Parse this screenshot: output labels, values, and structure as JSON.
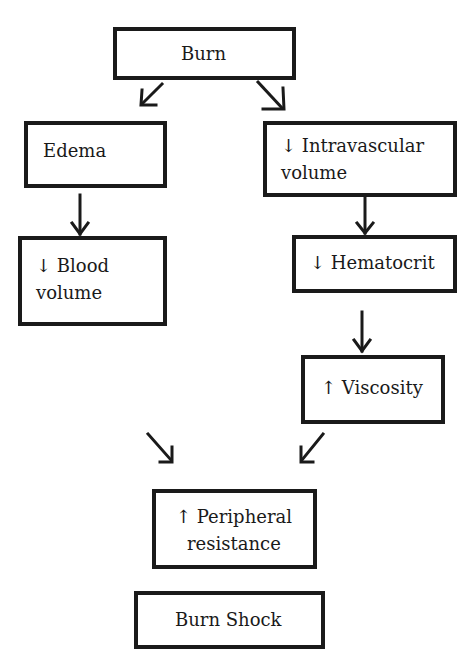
{
  "diagram": {
    "nodes": [
      {
        "id": "burn",
        "label": "Burn"
      },
      {
        "id": "edema",
        "label": "Edema"
      },
      {
        "id": "intravascular",
        "line1": "↓ Intravascular",
        "line2": "volume"
      },
      {
        "id": "blood_volume",
        "line1": "↓ Blood",
        "line2": "volume"
      },
      {
        "id": "hematocrit",
        "label": "↓ Hematocrit"
      },
      {
        "id": "viscosity",
        "label": "↑ Viscosity"
      },
      {
        "id": "peripheral",
        "line1": "↑ Peripheral",
        "line2": "resistance"
      },
      {
        "id": "burn_shock",
        "label": "Burn Shock"
      }
    ],
    "edges": [
      {
        "from": "burn",
        "to": "edema"
      },
      {
        "from": "burn",
        "to": "intravascular"
      },
      {
        "from": "edema",
        "to": "blood_volume"
      },
      {
        "from": "intravascular",
        "to": "hematocrit"
      },
      {
        "from": "hematocrit",
        "to": "viscosity"
      },
      {
        "from": "blood_volume",
        "to": "peripheral"
      },
      {
        "from": "viscosity",
        "to": "peripheral"
      }
    ],
    "colors": {
      "stroke": "#1a1a1a",
      "background": "#ffffff"
    }
  }
}
